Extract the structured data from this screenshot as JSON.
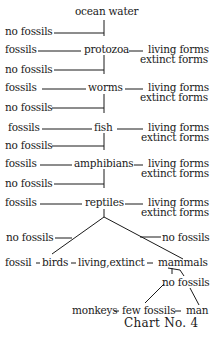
{
  "title": "ocean water",
  "caption": "Chart No. 4",
  "rows": [
    {
      "left": "no fossils"
    },
    {
      "left": "fossils",
      "node": "protozoa",
      "right1": "living forms",
      "right2": "extinct forms"
    },
    {
      "left": "no fossils"
    },
    {
      "left": "fossils",
      "node": "worms",
      "right1": "living forms",
      "right2": "extinct forms"
    },
    {
      "left": "no fossils"
    },
    {
      "left": "fossils",
      "node": "fish",
      "right1": "living forms",
      "right2": "extinct forms"
    },
    {
      "left": "no fossils"
    },
    {
      "left": "fossils",
      "node": "amphibians",
      "right1": "living forms",
      "right2": "extinct forms"
    },
    {
      "left": "no fossils"
    },
    {
      "left": "fossils",
      "node": "reptiles",
      "right1": "living forms",
      "right2": "extinct forms"
    }
  ],
  "branch": {
    "left_no_fossils": "no fossils",
    "right_no_fossils": "no fossils",
    "birds_fossil": "fossil",
    "birds": "birds",
    "birds_status": "living,extinct",
    "mammals": "mammals",
    "mammals_no_fossils": "no fossils",
    "monkeys": "monkeys",
    "few_fossils": "few fossils",
    "man": "man"
  }
}
